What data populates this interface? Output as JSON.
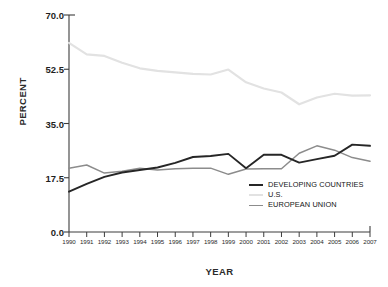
{
  "axes": {
    "y_title": "PERCENT",
    "x_title": "YEAR",
    "y_ticks": [
      "70.0",
      "52.5",
      "35.0",
      "17.5",
      "0.0"
    ],
    "x_ticks": [
      "1990",
      "1991",
      "1992",
      "1993",
      "1994",
      "1995",
      "1996",
      "1997",
      "1998",
      "1999",
      "2000",
      "2001",
      "2002",
      "2003",
      "2004",
      "2005",
      "2006",
      "2007"
    ]
  },
  "legend": {
    "items": [
      {
        "label": "DEVELOPING COUNTRIES",
        "color": "#262626"
      },
      {
        "label": "U.S.",
        "color": "#e2e2e2"
      },
      {
        "label": "EUROPEAN UNION",
        "color": "#8c8c8c"
      }
    ]
  },
  "chart_data": {
    "type": "line",
    "title": "",
    "subtitle": "",
    "xlabel": "YEAR",
    "ylabel": "PERCENT",
    "xlim": [
      1990,
      2007
    ],
    "ylim": [
      0.0,
      70.0
    ],
    "yticks": [
      0.0,
      17.5,
      35.0,
      52.5,
      70.0
    ],
    "grid": false,
    "legend_position": "inside lower-right",
    "x": [
      1990,
      1991,
      1992,
      1993,
      1994,
      1995,
      1996,
      1997,
      1998,
      1999,
      2000,
      2001,
      2002,
      2003,
      2004,
      2005,
      2006,
      2007
    ],
    "series": [
      {
        "name": "DEVELOPING COUNTRIES",
        "color": "#262626",
        "width": 1.9,
        "values": [
          13.0,
          15.5,
          17.8,
          19.2,
          20.0,
          20.8,
          22.3,
          24.2,
          24.5,
          25.2,
          20.6,
          24.9,
          24.9,
          22.4,
          23.5,
          24.6,
          28.2,
          27.8
        ]
      },
      {
        "name": "U.S.",
        "color": "#e2e2e2",
        "width": 2.2,
        "values": [
          61.0,
          57.3,
          56.8,
          54.6,
          52.8,
          52.0,
          51.5,
          51.0,
          50.8,
          52.4,
          48.3,
          46.3,
          45.0,
          41.2,
          43.4,
          44.6,
          44.0,
          44.1
        ]
      },
      {
        "name": "EUROPEAN UNION",
        "color": "#8c8c8c",
        "width": 1.5,
        "values": [
          20.6,
          21.6,
          19.0,
          19.6,
          20.6,
          20.0,
          20.4,
          20.6,
          20.6,
          18.6,
          20.3,
          20.4,
          20.4,
          25.4,
          27.8,
          26.4,
          24.0,
          22.8
        ]
      }
    ]
  }
}
